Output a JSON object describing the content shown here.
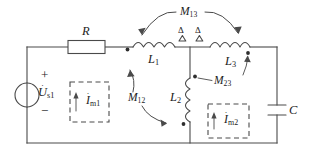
{
  "diagram": {
    "type": "electrical-schematic",
    "colors": {
      "wire": "#4a4a4a",
      "label": "#1c1c1c",
      "background": "#ffffff",
      "dot": "#2e2e2e"
    }
  },
  "source": {
    "label": "U",
    "subscript": "s1",
    "plus_sign": "+",
    "minus_sign": "−",
    "kind": "ac-voltage-source"
  },
  "components": {
    "resistor": {
      "label": "R"
    },
    "inductor_1": {
      "label": "L",
      "subscript": "1"
    },
    "inductor_2": {
      "label": "L",
      "subscript": "2"
    },
    "inductor_3": {
      "label": "L",
      "subscript": "3"
    },
    "capacitor": {
      "label": "C"
    }
  },
  "couplings": [
    {
      "label": "M",
      "subscript": "13"
    },
    {
      "label": "M",
      "subscript": "12"
    },
    {
      "label": "M",
      "subscript": "23"
    }
  ],
  "mesh_currents": [
    {
      "label": "I",
      "subscript": "m1"
    },
    {
      "label": "I",
      "subscript": "m2"
    }
  ],
  "markers": {
    "delta_left": "Δ",
    "delta_right": "Δ"
  }
}
